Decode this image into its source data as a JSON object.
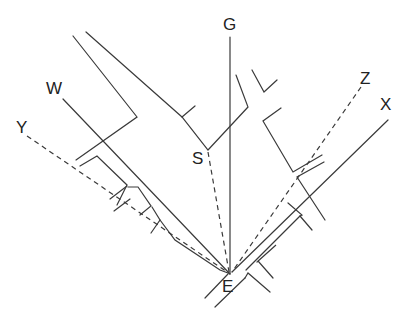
{
  "diagram": {
    "point_labels": {
      "G": "G",
      "W": "W",
      "Y": "Y",
      "Z": "Z",
      "X": "X",
      "S": "S",
      "E": "E"
    },
    "rays": [
      {
        "from": "E",
        "to": "G",
        "style": "solid"
      },
      {
        "from": "E",
        "to": "W",
        "style": "solid"
      },
      {
        "from": "E",
        "to": "Y",
        "style": "dashed"
      },
      {
        "from": "E",
        "to": "Z",
        "style": "dashed"
      },
      {
        "from": "E",
        "to": "X",
        "style": "solid"
      },
      {
        "from": "E",
        "to": "S",
        "style": "dashed"
      }
    ],
    "line_color": "#3a3a3a"
  }
}
